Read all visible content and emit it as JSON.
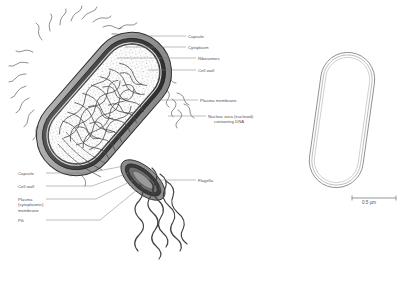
{
  "figure": {
    "background_color": "#ffffff",
    "line_color": "#555151",
    "ink_color": "#3a3a3a"
  },
  "labels_right": [
    {
      "key": "capsule",
      "text": "Capsule"
    },
    {
      "key": "cytoplasm",
      "text": "Cytoplasm"
    },
    {
      "key": "ribosomes",
      "text": "Ribosomes"
    },
    {
      "key": "cell_wall",
      "text": "Cell wall"
    },
    {
      "key": "plasma_membrane",
      "text": "Plasma membrane"
    },
    {
      "key": "nucleoid_line1",
      "text": "Nuclear area (nucleoid)"
    },
    {
      "key": "nucleoid_line2",
      "text": "containing DNA"
    }
  ],
  "labels_left": [
    {
      "key": "capsule2",
      "text": "Capsule"
    },
    {
      "key": "cell_wall2",
      "text": "Cell wall"
    },
    {
      "key": "plasma_l1",
      "text": "Plasma"
    },
    {
      "key": "plasma_l2",
      "text": "(cytoplasmic)"
    },
    {
      "key": "plasma_l3",
      "text": "membrane"
    },
    {
      "key": "pili",
      "text": "Pili"
    }
  ],
  "labels_other": [
    {
      "key": "flagella",
      "text": "Flagella"
    }
  ],
  "scale_bar": {
    "text": "0.5 µm",
    "length_px": 44
  },
  "colors": {
    "capsule_fill": "#9e9e9e",
    "wall_fill": "#4a4a4a",
    "cytoplasm_fill": "#fbfbfb",
    "nucleoid": "#4d4d4d",
    "outline": "#2e2e2e",
    "leader": "#7d7a7a"
  }
}
